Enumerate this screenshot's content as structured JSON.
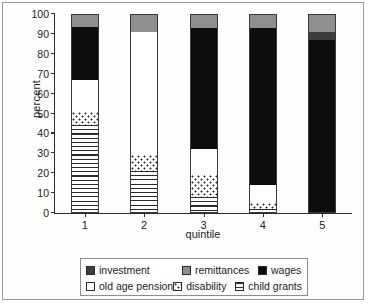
{
  "chart_data": {
    "type": "bar",
    "subtype": "stacked-bar-100percent",
    "title": "",
    "xlabel": "quintile",
    "ylabel": "percent",
    "categories": [
      "1",
      "2",
      "3",
      "4",
      "5"
    ],
    "ylim": [
      0,
      100
    ],
    "yticks": [
      0,
      10,
      20,
      30,
      40,
      50,
      60,
      70,
      80,
      90,
      100
    ],
    "grid": false,
    "legend_position": "bottom",
    "stack_order_bottom_to_top": [
      "child grants",
      "disability",
      "old age pension",
      "wages",
      "investment",
      "remittances"
    ],
    "series": [
      {
        "name": "child grants",
        "values": [
          44,
          21,
          8,
          2,
          0
        ]
      },
      {
        "name": "disability",
        "values": [
          7,
          8,
          11,
          3,
          0
        ]
      },
      {
        "name": "old age pension",
        "values": [
          16,
          62,
          13,
          9,
          0
        ]
      },
      {
        "name": "wages",
        "values": [
          26.5,
          0,
          61,
          79,
          87
        ]
      },
      {
        "name": "investment",
        "values": [
          0,
          0,
          0,
          0,
          4
        ]
      },
      {
        "name": "remittances",
        "values": [
          6.5,
          9,
          7,
          7,
          9
        ]
      }
    ]
  },
  "axes": {
    "ylabel": "percent",
    "xlabel": "quintile",
    "ytick_labels": [
      "100",
      "90",
      "80",
      "70",
      "60",
      "50",
      "40",
      "30",
      "20",
      "10",
      "0"
    ],
    "xtick_labels": [
      "1",
      "2",
      "3",
      "4",
      "5"
    ]
  },
  "legend": {
    "items": [
      {
        "label": "investment",
        "swatch": "investment",
        "pattern": "solid-dark-gray"
      },
      {
        "label": "remittances",
        "swatch": "remittances",
        "pattern": "solid-gray"
      },
      {
        "label": "wages",
        "swatch": "wages",
        "pattern": "solid-black"
      },
      {
        "label": "old age pension",
        "swatch": "old-age-pension",
        "pattern": "solid-white"
      },
      {
        "label": "disability",
        "swatch": "disability",
        "pattern": "dotted"
      },
      {
        "label": "child grants",
        "swatch": "child-grants",
        "pattern": "horizontal-lines"
      }
    ]
  },
  "colors": {
    "wages": "#0d0d0d",
    "investment": "#3d3d3d",
    "remittances": "#8e8e8e",
    "old_age_pension": "#ffffff",
    "disability": "#ffffff",
    "child_grants": "#ffffff",
    "axis": "#2b2b2b",
    "frame": "#9a9a9a",
    "background": "#ffffff"
  }
}
